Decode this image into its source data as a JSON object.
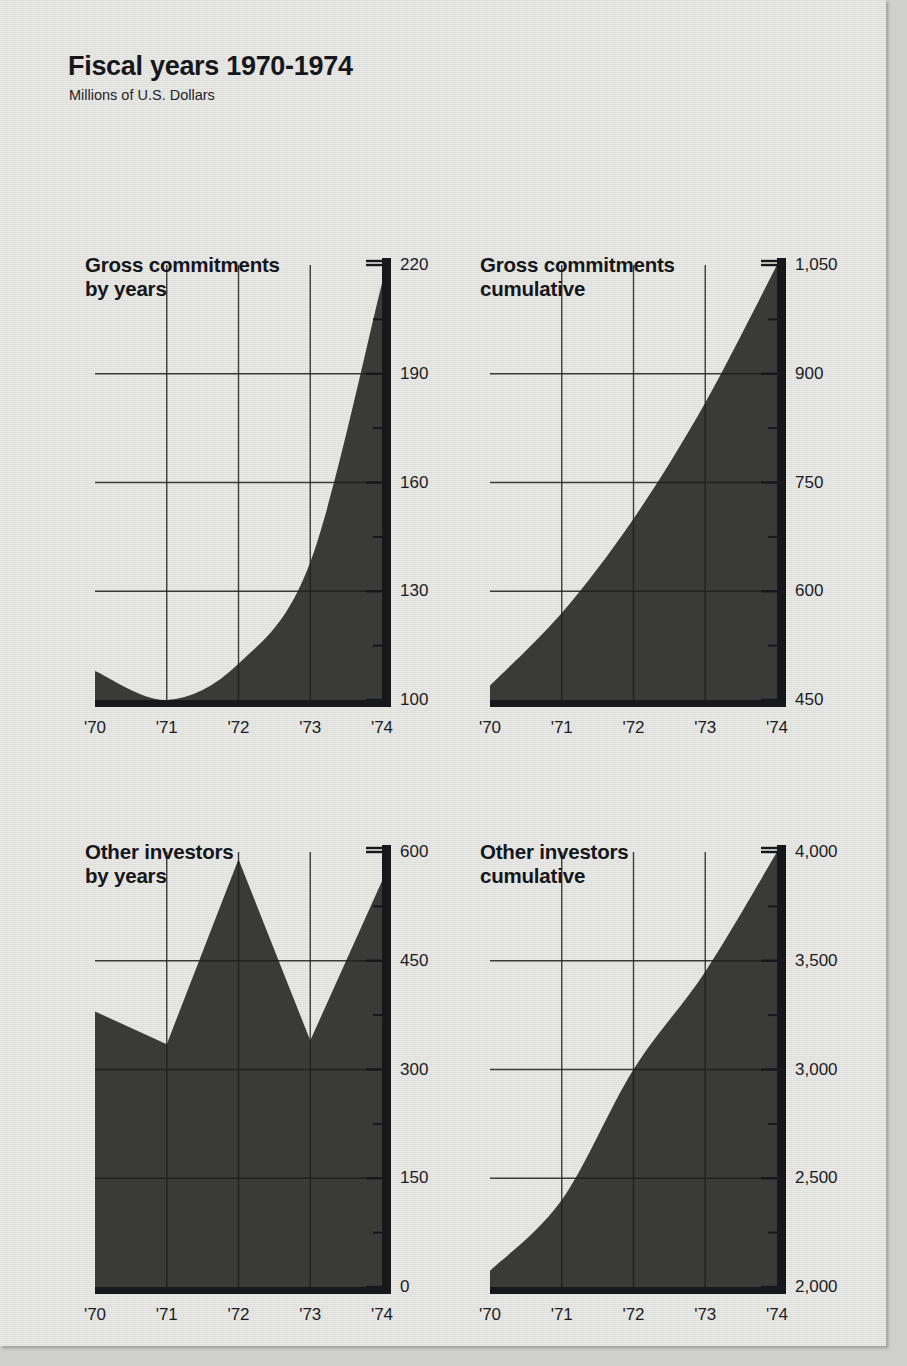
{
  "header": {
    "title": "Fiscal years 1970-1974",
    "subtitle": "Millions of U.S. Dollars"
  },
  "palette": {
    "paper": "#e4e4e1",
    "ink": "#17181b",
    "fill": "#3a3a38",
    "grid": "#1d1d1c"
  },
  "chart_data": [
    {
      "id": "gross-commitments-by-years",
      "type": "area",
      "title": "Gross commitments\nby years",
      "categories": [
        "'70",
        "'71",
        "'72",
        "'73",
        "'74"
      ],
      "values": [
        108,
        100,
        110,
        138,
        215
      ],
      "ylim": [
        100,
        220
      ],
      "yticks": [
        100,
        130,
        160,
        190,
        220
      ],
      "ytick_labels": [
        "100",
        "130",
        "160",
        "190",
        "220"
      ],
      "minor_yticks": [
        115,
        145,
        175,
        205
      ],
      "xlabel": "",
      "ylabel": "",
      "grid": true,
      "legend": "none"
    },
    {
      "id": "gross-commitments-cumulative",
      "type": "area",
      "title": "Gross commitments\ncumulative",
      "categories": [
        "'70",
        "'71",
        "'72",
        "'73",
        "'74"
      ],
      "values": [
        470,
        570,
        700,
        860,
        1050
      ],
      "ylim": [
        450,
        1050
      ],
      "yticks": [
        450,
        600,
        750,
        900,
        1050
      ],
      "ytick_labels": [
        "450",
        "600",
        "750",
        "900",
        "1,050"
      ],
      "minor_yticks": [
        525,
        675,
        825,
        975
      ],
      "xlabel": "",
      "ylabel": "",
      "grid": true,
      "legend": "none"
    },
    {
      "id": "other-investors-by-years",
      "type": "area",
      "title": "Other investors\nby years",
      "categories": [
        "'70",
        "'71",
        "'72",
        "'73",
        "'74"
      ],
      "values": [
        380,
        335,
        590,
        340,
        560
      ],
      "ylim": [
        0,
        600
      ],
      "yticks": [
        0,
        150,
        300,
        450,
        600
      ],
      "ytick_labels": [
        "0",
        "150",
        "300",
        "450",
        "600"
      ],
      "minor_yticks": [
        75,
        225,
        375,
        525
      ],
      "xlabel": "",
      "ylabel": "",
      "grid": true,
      "legend": "none"
    },
    {
      "id": "other-investors-cumulative",
      "type": "area",
      "title": "Other investors\ncumulative",
      "categories": [
        "'70",
        "'71",
        "'72",
        "'73",
        "'74"
      ],
      "values": [
        2075,
        2400,
        3000,
        3450,
        4000
      ],
      "ylim": [
        2000,
        4000
      ],
      "yticks": [
        2000,
        2500,
        3000,
        3500,
        4000
      ],
      "ytick_labels": [
        "2,000",
        "2,500",
        "3,000",
        "3,500",
        "4,000"
      ],
      "minor_yticks": [
        2250,
        2750,
        3250,
        3750
      ],
      "xlabel": "",
      "ylabel": "",
      "grid": true,
      "legend": "none"
    }
  ]
}
